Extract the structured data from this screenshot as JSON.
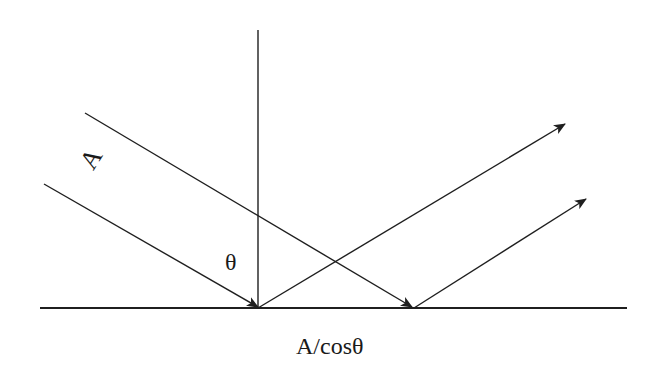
{
  "diagram": {
    "type": "wave-reflection-geometry",
    "colors": {
      "line": "#1f1f1f",
      "background": "#ffffff"
    },
    "labels": {
      "amplitude": "A",
      "angle": "θ",
      "projected_width": "A/cosθ"
    },
    "elements": {
      "surface_line": "horizontal surface",
      "normal_line": "vertical normal",
      "incident_rays": 2,
      "reflected_rays": 2
    }
  }
}
